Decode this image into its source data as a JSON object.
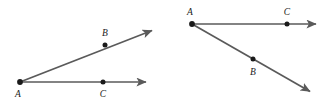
{
  "figure": {
    "background_color": "#ffffff",
    "line_color": "#5a5a5a",
    "point_color": "#1a1a1a",
    "label_color": "#1a1a1a"
  },
  "diagrams": [
    {
      "id": "left-angle",
      "name": "angle-BAC-open-upward",
      "vertex": {
        "label": "A",
        "x": 20,
        "y": 82,
        "label_x": 18,
        "label_y": 96
      },
      "rays": [
        {
          "id": "left-ray-AB",
          "name": "ray-A-through-B",
          "from_x": 20,
          "from_y": 82,
          "to_x": 156,
          "to_y": 29,
          "point": {
            "label": "B",
            "x": 105,
            "y": 45,
            "label_x": 105,
            "label_y": 35
          },
          "arrowhead": true
        },
        {
          "id": "left-ray-AC",
          "name": "ray-A-through-C",
          "from_x": 20,
          "from_y": 82,
          "to_x": 150,
          "to_y": 82,
          "point": {
            "label": "C",
            "x": 103,
            "y": 82,
            "label_x": 103,
            "label_y": 96
          },
          "arrowhead": true
        }
      ]
    },
    {
      "id": "right-angle",
      "name": "angle-CAB-open-downward",
      "vertex": {
        "label": "A",
        "x": 192,
        "y": 24,
        "label_x": 190,
        "label_y": 14
      },
      "rays": [
        {
          "id": "right-ray-AC",
          "name": "ray-A-through-C",
          "from_x": 192,
          "from_y": 24,
          "to_x": 320,
          "to_y": 24,
          "point": {
            "label": "C",
            "x": 287,
            "y": 24,
            "label_x": 287,
            "label_y": 14
          },
          "arrowhead": true
        },
        {
          "id": "right-ray-AB",
          "name": "ray-A-through-B",
          "from_x": 192,
          "from_y": 24,
          "to_x": 314,
          "to_y": 94,
          "point": {
            "label": "B",
            "x": 253,
            "y": 59,
            "label_x": 253,
            "label_y": 75
          },
          "arrowhead": true
        }
      ]
    }
  ],
  "labels": {
    "left_vertex": "A",
    "left_point_b": "B",
    "left_point_c": "C",
    "right_vertex": "A",
    "right_point_b": "B",
    "right_point_c": "C"
  }
}
